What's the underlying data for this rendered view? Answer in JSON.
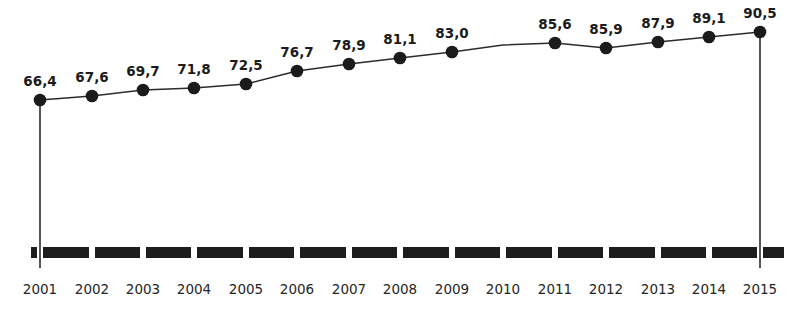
{
  "chart_data": {
    "type": "line",
    "title": "",
    "subtitle": "",
    "xlabel": "",
    "ylabel": "",
    "grid": false,
    "legend": null,
    "legend_position": "none",
    "xlim": [
      2001,
      2015
    ],
    "ylim": [
      0,
      90.5
    ],
    "axis_style": "thick-segmented-bar",
    "series": [
      {
        "name": "",
        "color": "#1b1b1b",
        "marker": "circle",
        "categories": [
          "2001",
          "2002",
          "2003",
          "2004",
          "2005",
          "2006",
          "2007",
          "2008",
          "2009",
          "2010",
          "2011",
          "2012",
          "2013",
          "2014",
          "2015"
        ],
        "values": [
          66.4,
          67.6,
          69.7,
          71.8,
          72.5,
          76.7,
          78.9,
          81.1,
          83.0,
          null,
          85.6,
          85.9,
          87.9,
          89.1,
          90.5
        ],
        "labels": [
          "66,4",
          "67,6",
          "69,7",
          "71,8",
          "72,5",
          "76,7",
          "78,9",
          "81,1",
          "83,0",
          "",
          "85,6",
          "85,9",
          "87,9",
          "89,1",
          "90,5"
        ]
      }
    ],
    "tick_labels": [
      "2001",
      "2002",
      "2003",
      "2004",
      "2005",
      "2006",
      "2007",
      "2008",
      "2009",
      "2010",
      "2011",
      "2012",
      "2013",
      "2014",
      "2015"
    ],
    "colors": {
      "line": "#2b2b2b",
      "marker": "#1b1b1b",
      "axis_bar": "#1d1d1d",
      "label_text": "#1b1b1b",
      "tick_text": "#262626",
      "background": "#ffffff"
    }
  },
  "points": [
    {
      "label": "66,4",
      "tick": "2001",
      "x": 40,
      "y": 100,
      "has_marker": true,
      "drop_line": true
    },
    {
      "label": "67,6",
      "tick": "2002",
      "x": 92,
      "y": 96,
      "has_marker": true,
      "drop_line": false
    },
    {
      "label": "69,7",
      "tick": "2003",
      "x": 143,
      "y": 90,
      "has_marker": true,
      "drop_line": false
    },
    {
      "label": "71,8",
      "tick": "2004",
      "x": 194,
      "y": 88,
      "has_marker": true,
      "drop_line": false
    },
    {
      "label": "72,5",
      "tick": "2005",
      "x": 246,
      "y": 84,
      "has_marker": true,
      "drop_line": false
    },
    {
      "label": "76,7",
      "tick": "2006",
      "x": 297,
      "y": 71,
      "has_marker": true,
      "drop_line": false
    },
    {
      "label": "78,9",
      "tick": "2007",
      "x": 349,
      "y": 64,
      "has_marker": true,
      "drop_line": false
    },
    {
      "label": "81,1",
      "tick": "2008",
      "x": 400,
      "y": 58,
      "has_marker": true,
      "drop_line": false
    },
    {
      "label": "83,0",
      "tick": "2009",
      "x": 452,
      "y": 52,
      "has_marker": true,
      "drop_line": false
    },
    {
      "label": "",
      "tick": "2010",
      "x": 503,
      "y": 45,
      "has_marker": false,
      "drop_line": false
    },
    {
      "label": "85,6",
      "tick": "2011",
      "x": 555,
      "y": 43,
      "has_marker": true,
      "drop_line": false
    },
    {
      "label": "85,9",
      "tick": "2012",
      "x": 606,
      "y": 48,
      "has_marker": true,
      "drop_line": false
    },
    {
      "label": "87,9",
      "tick": "2013",
      "x": 658,
      "y": 42,
      "has_marker": true,
      "drop_line": false
    },
    {
      "label": "89,1",
      "tick": "2014",
      "x": 709,
      "y": 37,
      "has_marker": true,
      "drop_line": false
    },
    {
      "label": "90,5",
      "tick": "2015",
      "x": 760,
      "y": 32,
      "has_marker": true,
      "drop_line": true
    }
  ]
}
